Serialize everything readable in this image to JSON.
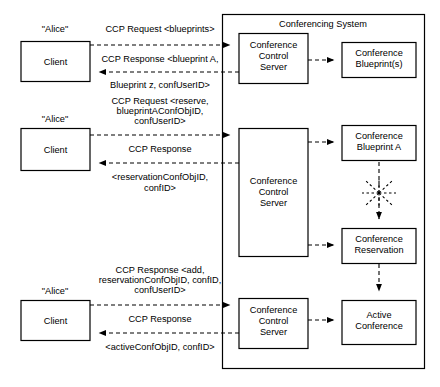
{
  "diagram": {
    "title": "Conferencing System",
    "type": "sequence-block-diagram",
    "container": {
      "label": "Conferencing System"
    },
    "actors": [
      {
        "id": "actor-1",
        "label": "\"Alice\"",
        "box_label": "Client"
      },
      {
        "id": "actor-2",
        "label": "\"Alice\"",
        "box_label": "Client"
      },
      {
        "id": "actor-3",
        "label": "\"Alice\"",
        "box_label": "Client"
      }
    ],
    "servers": [
      {
        "id": "ccs-1",
        "line1": "Conference",
        "line2": "Control",
        "line3": "Server"
      },
      {
        "id": "ccs-2",
        "line1": "Conference",
        "line2": "Control",
        "line3": "Server"
      },
      {
        "id": "ccs-3",
        "line1": "Conference",
        "line2": "Control",
        "line3": "Server"
      }
    ],
    "resources": [
      {
        "id": "res-blueprints",
        "line1": "Conference",
        "line2": "Blueprint(s)"
      },
      {
        "id": "res-blueprint-a",
        "line1": "Conference",
        "line2": "Blueprint A"
      },
      {
        "id": "res-reservation",
        "line1": "Conference",
        "line2": "Reservation"
      },
      {
        "id": "res-active",
        "line1": "Active",
        "line2": "Conference"
      }
    ],
    "messages": {
      "m1_request": "CCP Request <blueprints>",
      "m1_response_line1": "CCP Response <blueprint A,",
      "m1_response_line2": "Blueprint z, confUserID>",
      "m2_request_line1": "CCP Request <reserve,",
      "m2_request_line2": "blueprintAConfObjID,",
      "m2_request_line3": "confUserID>",
      "m2_response_line1": "CCP Response",
      "m2_response_line2": "<reservationConfObjID,",
      "m2_response_line3": "confID>",
      "m3_request_line1": "CCP Response <add,",
      "m3_request_line2": "reservationConfObjID, confID,",
      "m3_request_line3": "confUserID>",
      "m3_response_line1": "CCP Response",
      "m3_response_line2": "<activeConfObjID, confID>"
    },
    "colors": {
      "stroke": "#000000",
      "fill": "#ffffff",
      "text": "#000000"
    }
  }
}
